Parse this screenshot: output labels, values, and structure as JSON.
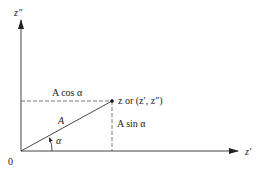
{
  "diagram": {
    "axes": {
      "horizontal_label": "z′",
      "vertical_label": "z″",
      "origin_label": "0"
    },
    "vector": {
      "magnitude_label": "A",
      "angle_label": "α",
      "point_label": "z or (z′, z″)"
    },
    "projections": {
      "horizontal": "A cos α",
      "vertical": "A sin α"
    },
    "colors": {
      "ink": "#222222",
      "dashed": "#555555",
      "background": "#ffffff"
    }
  }
}
